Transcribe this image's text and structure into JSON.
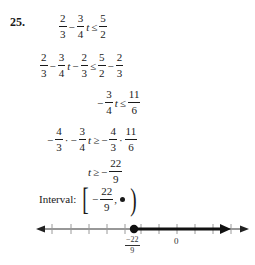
{
  "problem": {
    "number": "25.",
    "steps": [
      {
        "id": "step1",
        "tokens": {
          "a_num": "2",
          "a_den": "3",
          "op1": "−",
          "b_num": "3",
          "b_den": "4",
          "var": "t",
          "rel": "≤",
          "c_num": "5",
          "c_den": "2"
        }
      },
      {
        "id": "step2",
        "tokens": {
          "a_num": "2",
          "a_den": "3",
          "op1": "−",
          "b_num": "3",
          "b_den": "4",
          "var": "t",
          "op2": "−",
          "c_num": "2",
          "c_den": "3",
          "rel": "≤",
          "d_num": "5",
          "d_den": "2",
          "op3": "−",
          "e_num": "2",
          "e_den": "3"
        }
      },
      {
        "id": "step3",
        "tokens": {
          "neg": "−",
          "a_num": "3",
          "a_den": "4",
          "var": "t",
          "rel": "≤",
          "b_num": "11",
          "b_den": "6"
        }
      },
      {
        "id": "step4",
        "tokens": {
          "neg1": "−",
          "a_num": "4",
          "a_den": "3",
          "dot1": "·",
          "neg2": "−",
          "b_num": "3",
          "b_den": "4",
          "var": "t",
          "rel": "≥",
          "neg3": "−",
          "c_num": "4",
          "c_den": "3",
          "dot2": "·",
          "d_num": "11",
          "d_den": "6"
        }
      },
      {
        "id": "step5",
        "tokens": {
          "var": "t",
          "rel": "≥",
          "neg": "−",
          "a_num": "22",
          "a_den": "9"
        }
      }
    ],
    "interval": {
      "label": "Interval:",
      "left_bracket": "[",
      "neg": "−",
      "lower_num": "22",
      "lower_den": "9",
      "comma": ",",
      "upper": "∞",
      "right_paren": ")"
    }
  },
  "number_line": {
    "endpoint_label_neg": "−",
    "endpoint_label_num": "22",
    "endpoint_label_den": "9",
    "endpoint_value": -2.444,
    "endpoint_closed": true,
    "zero_label": "0",
    "shaded_direction": "right",
    "colors": {
      "line": "#333333",
      "shade": "#111111",
      "tick": "#999999"
    }
  }
}
